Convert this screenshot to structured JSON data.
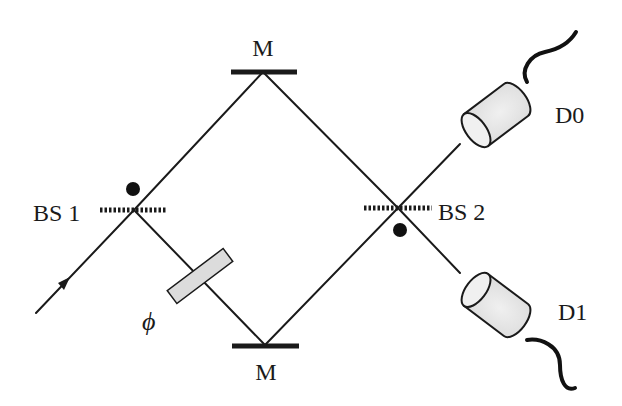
{
  "diagram": {
    "type": "Mach-Zehnder interferometer",
    "labels": {
      "mirror_top": "M",
      "mirror_bottom": "M",
      "beam_splitter_1": "BS 1",
      "beam_splitter_2": "BS 2",
      "phase_shifter": "ϕ",
      "detector_0": "D0",
      "detector_1": "D1"
    },
    "colors": {
      "line": "#1a1a1a",
      "detector_fill": "#e6e6e6",
      "phase_plate_fill": "#dcdcdc",
      "background": "#ffffff"
    }
  }
}
